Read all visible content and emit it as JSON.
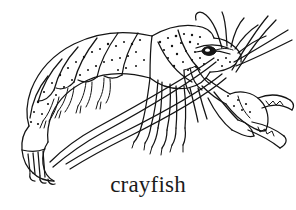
{
  "figure": {
    "subject": "crayfish",
    "caption": "crayfish",
    "style": "black-and-white line drawing with stipple shading",
    "background_color": "#ffffff",
    "ink_color": "#141414",
    "caption_color": "#1b1b1b",
    "width": 296,
    "height": 210,
    "orientation": "side view, head at right, tail at left"
  },
  "parts": [
    {
      "name": "carapace",
      "label": "carapace",
      "note": "large stippled head-shield over thorax, upper middle-right of drawing"
    },
    {
      "name": "abdomen",
      "label": "abdomen",
      "note": "segmented stippled tail curving to the lower left"
    },
    {
      "name": "telson-uropods",
      "label": "tail fan",
      "note": "fan-shaped tail plates with fine striations at far lower left"
    },
    {
      "name": "eye",
      "label": "compound eye",
      "note": "dark filled oval with white highlight near the head at right"
    },
    {
      "name": "rostrum",
      "label": "rostrum",
      "note": "pointed snout projecting forward between the eyes"
    },
    {
      "name": "antennae",
      "label": "antennae",
      "note": "several long curving whip-like feelers sweeping up-right and down-left"
    },
    {
      "name": "antennules",
      "label": "antennules",
      "note": "shorter paired feelers curling above the head"
    },
    {
      "name": "chela",
      "label": "claw (chela)",
      "note": "large pincer at right with serrated opposing fingers"
    },
    {
      "name": "walking-legs",
      "label": "walking legs",
      "note": "four pairs of jointed legs hanging below the thorax"
    },
    {
      "name": "swimmerets",
      "label": "swimmerets",
      "note": "small paired appendages beneath the abdominal segments"
    }
  ]
}
